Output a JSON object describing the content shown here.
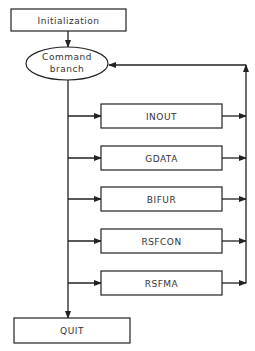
{
  "diagram": {
    "start": {
      "label": "Initialization"
    },
    "branch": {
      "line1": "Command",
      "line2": "branch"
    },
    "modules": [
      {
        "label": "INOUT"
      },
      {
        "label": "GDATA"
      },
      {
        "label": "BIFUR"
      },
      {
        "label": "RSFCON"
      },
      {
        "label": "RSFMA"
      }
    ],
    "end": {
      "label": "QUIT"
    },
    "colors": {
      "stroke": "#222222",
      "background": "#ffffff"
    }
  }
}
